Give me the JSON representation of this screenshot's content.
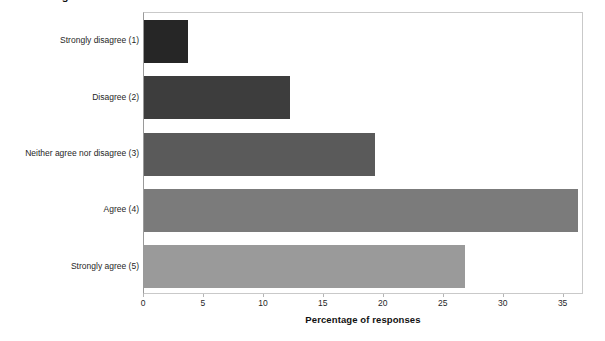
{
  "title_fragment": "Figure",
  "chart_data": {
    "type": "bar",
    "orientation": "horizontal",
    "title": "",
    "xlabel": "Percentage of responses",
    "ylabel": "",
    "categories": [
      "Strongly disagree (1)",
      "Disagree (2)",
      "Neither agree nor disagree (3)",
      "Agree (4)",
      "Strongly agree (5)"
    ],
    "values": [
      3.7,
      12.2,
      19.3,
      36.2,
      26.8
    ],
    "bar_colors": [
      "#262626",
      "#3d3d3d",
      "#5a5a5a",
      "#7b7b7b",
      "#9a9a9a"
    ],
    "xlim": [
      0,
      36.7
    ],
    "xticks": [
      0,
      5,
      10,
      15,
      20,
      25,
      30,
      35
    ],
    "xtick_labels": [
      "0",
      "5",
      "10",
      "15",
      "20",
      "25",
      "30",
      "35"
    ],
    "grid": false,
    "legend": "none"
  }
}
